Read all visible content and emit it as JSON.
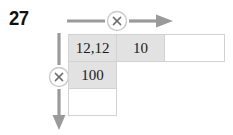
{
  "exercise": {
    "number": "27"
  },
  "operators": {
    "horizontal_symbol": "×",
    "vertical_symbol": "×",
    "horizontal_icon": "multiply-circle-icon",
    "vertical_icon": "multiply-circle-icon",
    "horizontal_arrow_icon": "arrow-right-icon",
    "vertical_arrow_icon": "arrow-down-icon"
  },
  "grid": {
    "rows": [
      {
        "cells": [
          {
            "text": "12,12",
            "state": "filled"
          },
          {
            "text": "10",
            "state": "filled"
          },
          {
            "text": "",
            "state": "blank"
          }
        ]
      },
      {
        "cells": [
          {
            "text": "100",
            "state": "filled"
          },
          {
            "text": "",
            "state": "nocell"
          },
          {
            "text": "",
            "state": "nocell"
          }
        ]
      },
      {
        "cells": [
          {
            "text": "",
            "state": "blank"
          },
          {
            "text": "",
            "state": "nocell"
          },
          {
            "text": "",
            "state": "nocell"
          }
        ]
      }
    ]
  },
  "colors": {
    "filled_cell": "#e2e2e2",
    "blank_cell": "#ffffff",
    "cell_border": "#d2d2d2",
    "arrow": "#9a9a9a",
    "operator_circle_stroke": "#c9c9c9",
    "operator_symbol": "#6f6f6f",
    "number_text": "#111111"
  }
}
